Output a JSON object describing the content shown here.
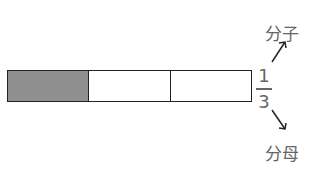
{
  "fraction_bar": {
    "parts": 3,
    "shaded_parts": 1,
    "shaded_color": "#8f8f8f"
  },
  "fraction": {
    "numerator": "1",
    "denominator": "3"
  },
  "labels": {
    "numerator_label": "分子",
    "denominator_label": "分母"
  }
}
